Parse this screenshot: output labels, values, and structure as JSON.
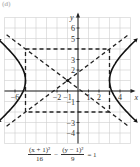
{
  "figure": {
    "label": "(d)"
  },
  "chart_data": {
    "type": "line",
    "title": "",
    "equation": {
      "term1_num": "(x + 1)²",
      "term1_den": "16",
      "minus": "−",
      "term2_num": "(y − 1)²",
      "term2_den": "9",
      "rhs": "= 1"
    },
    "xlabel": "x",
    "ylabel": "y",
    "xlim": [
      -7,
      5
    ],
    "ylim": [
      -5,
      7
    ],
    "grid": true,
    "x_ticks": [
      -6,
      -2,
      -1,
      1,
      2,
      4
    ],
    "x_tick_labels": [
      "−6",
      "−2",
      "−1",
      "1",
      "2",
      "4"
    ],
    "y_ticks": [
      6,
      5,
      3,
      2,
      -1,
      -3,
      -4
    ],
    "y_tick_labels": [
      "6",
      "5",
      "3",
      "2",
      "−1",
      "−3",
      "−4"
    ],
    "center": [
      -1,
      1
    ],
    "a": 4,
    "b": 3,
    "vertices": [
      [
        -5,
        1
      ],
      [
        3,
        1
      ]
    ],
    "fundamental_rectangle": {
      "x": [
        -5,
        3
      ],
      "y": [
        -2,
        4
      ]
    },
    "asymptotes": [
      {
        "slope": 0.75,
        "intercept": 1.75,
        "label": "y − 1 = (3/4)(x + 1)"
      },
      {
        "slope": -0.75,
        "intercept": 0.25,
        "label": "y − 1 = −(3/4)(x + 1)"
      }
    ],
    "series": [
      {
        "name": "left branch",
        "style": "solid",
        "x_range": [
          -6.6,
          -5
        ]
      },
      {
        "name": "right branch",
        "style": "solid",
        "x_range": [
          3,
          4.6
        ]
      }
    ]
  }
}
